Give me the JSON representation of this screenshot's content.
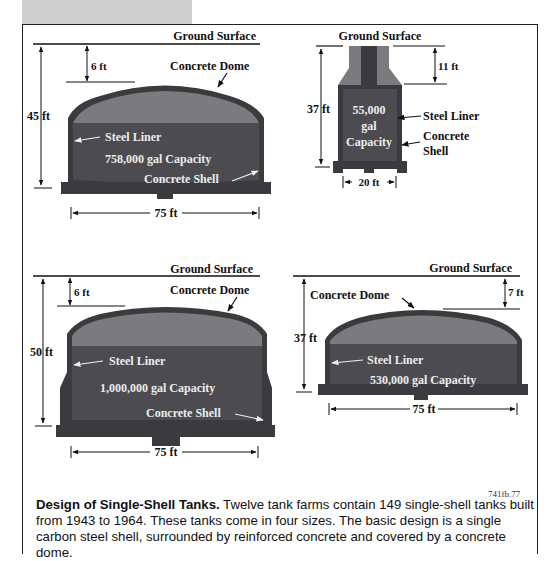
{
  "figure": {
    "figure_id": "741fb.77",
    "caption": {
      "title": "Design of Single-Shell Tanks.",
      "text": " Twelve tank farms contain 149 single-shell tanks built from 1943 to 1964. These tanks come in four sizes. The basic design is a single carbon steel shell, surrounded by reinforced concrete and covered by a concrete dome."
    },
    "colors": {
      "dome_fill": "#7b7b7d",
      "liquid_fill": "#4b4b50",
      "shell": "#3a3a3f",
      "line": "#111111"
    }
  },
  "tanks": [
    {
      "name": "758,000 gal tank",
      "ground_label": "Ground Surface",
      "dome_label": "Concrete Dome",
      "liner_label": "Steel Liner",
      "capacity_label": "758,000 gal Capacity",
      "shell_label": "Concrete Shell",
      "height_label": "45 ft",
      "cover_label": "6 ft",
      "width_label": "75 ft"
    },
    {
      "name": "55,000 gal tank",
      "ground_label": "Ground Surface",
      "liner_label": "Steel Liner",
      "capacity_line1": "55,000",
      "capacity_line2": "gal",
      "capacity_line3": "Capacity",
      "shell_line1": "Concrete",
      "shell_line2": "Shell",
      "height_label": "37 ft",
      "cover_label": "11 ft",
      "width_label": "20 ft"
    },
    {
      "name": "1,000,000 gal tank",
      "ground_label": "Ground Surface",
      "dome_label": "Concrete Dome",
      "liner_label": "Steel Liner",
      "capacity_label": "1,000,000 gal Capacity",
      "shell_label": "Concrete Shell",
      "height_label": "50 ft",
      "cover_label": "6 ft",
      "width_label": "75 ft"
    },
    {
      "name": "530,000 gal tank",
      "ground_label": "Ground Surface",
      "dome_label": "Concrete Dome",
      "liner_label": "Steel Liner",
      "capacity_label": "530,000 gal Capacity",
      "height_label": "37 ft",
      "cover_label": "7 ft",
      "width_label": "75 ft"
    }
  ]
}
